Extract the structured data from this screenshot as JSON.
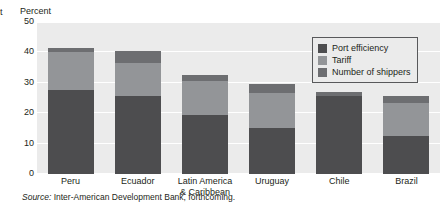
{
  "edge_glyph": "t",
  "source_note": {
    "label": "Source:",
    "text": "Inter-American Development Bank, forthcoming."
  },
  "colors": {
    "port_efficiency": "#4d4d4f",
    "tariff": "#939598",
    "number_of_shippers": "#6d6e71",
    "panel_background": "#ebebeb",
    "gridline": "#ffffff",
    "text": "#231f20"
  },
  "chart_data": {
    "type": "bar",
    "stacked": true,
    "title": "",
    "subtitle": "",
    "xlabel": "",
    "ylabel": "Percent",
    "ylim": [
      0,
      50
    ],
    "yticks": [
      0,
      10,
      20,
      30,
      40,
      50
    ],
    "ytick_labels": [
      "0",
      "10",
      "20",
      "30",
      "40",
      "50"
    ],
    "grid": true,
    "legend_position": "top-right",
    "categories": [
      "Peru",
      "Latin America & Caribbean",
      "Ecuador",
      "Uruguay",
      "Chile",
      "Brazil"
    ],
    "category_labels": [
      [
        "Peru"
      ],
      [
        "Ecuador"
      ],
      [
        "Latin America",
        "& Caribbean"
      ],
      [
        "Uruguay"
      ],
      [
        "Chile"
      ],
      [
        "Brazil"
      ]
    ],
    "category_order": [
      "Peru",
      "Ecuador",
      "Latin America & Caribbean",
      "Uruguay",
      "Chile",
      "Brazil"
    ],
    "series": [
      {
        "name": "Port efficiency",
        "color": "#4d4d4f",
        "values": [
          27.5,
          25.5,
          19.5,
          15.0,
          25.5,
          12.5
        ]
      },
      {
        "name": "Tariff",
        "color": "#939598",
        "values": [
          12.5,
          11.0,
          11.0,
          11.5,
          0.0,
          11.0
        ]
      },
      {
        "name": "Number of shippers",
        "color": "#6d6e71",
        "values": [
          1.5,
          4.0,
          2.0,
          3.0,
          1.5,
          2.0
        ]
      }
    ],
    "totals": [
      41.5,
      40.5,
      32.5,
      29.5,
      27.0,
      25.5
    ]
  }
}
